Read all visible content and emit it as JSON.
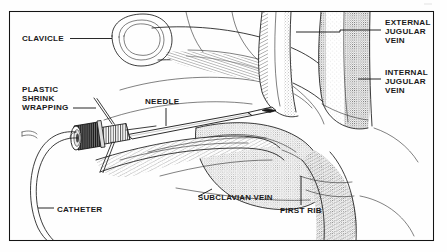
{
  "figure": {
    "kind": "line-art medical illustration",
    "background_color": "#fefefe",
    "ink_color": "#1a1a1a",
    "frame": {
      "present": true,
      "x": 9,
      "y": 11,
      "width": 425,
      "height": 230,
      "stroke_color": "#141414"
    }
  },
  "labels": [
    {
      "id": "clavicle",
      "lines": [
        "CLAVICLE"
      ],
      "text_x": 22,
      "text_y": 41,
      "align": "start",
      "leader": "M 70 38.5 L 112 38.5",
      "points_to": "clavicle bone cross-section, upper left"
    },
    {
      "id": "plastic-shrink-wrapping",
      "lines": [
        "PLASTIC",
        "SHRINK",
        "WRAPPING"
      ],
      "text_x": 22,
      "text_y": 92,
      "align": "start",
      "leader": "M 73 108 L 96 108",
      "points_to": "plastic shrink wrapping over needle hub"
    },
    {
      "id": "needle",
      "lines": [
        "NEEDLE"
      ],
      "text_x": 145,
      "text_y": 104,
      "align": "start",
      "leader": "M 166 108 L 166 126",
      "points_to": "needle shaft"
    },
    {
      "id": "catheter",
      "lines": [
        "CATHETER"
      ],
      "text_x": 57,
      "text_y": 212,
      "align": "start",
      "leader": "M 38 208 L 54 208",
      "points_to": "catheter tubing loop, lower left"
    },
    {
      "id": "subclavian-vein",
      "lines": [
        "SUBCLAVIAN VEIN"
      ],
      "text_x": 198,
      "text_y": 200,
      "align": "start",
      "leader": "M 198 196.5 L 212 189",
      "points_to": "subclavian vein beneath clavicle"
    },
    {
      "id": "first-rib",
      "lines": [
        "FIRST RIB"
      ],
      "text_x": 280,
      "text_y": 213,
      "align": "start",
      "leader": "M 301 176 L 301 205",
      "points_to": "first rib"
    },
    {
      "id": "external-jugular-vein",
      "lines": [
        "EXTERNAL",
        "JUGULAR",
        "VEIN"
      ],
      "text_x": 385,
      "text_y": 25,
      "align": "start",
      "leader": "M 296 32 L 340 32 L 340 30 L 381 30",
      "points_to": "external jugular vein, smaller left vessel"
    },
    {
      "id": "internal-jugular-vein",
      "lines": [
        "INTERNAL",
        "JUGULAR",
        "VEIN"
      ],
      "text_x": 385,
      "text_y": 75,
      "align": "start",
      "leader": "M 358 79 L 381 79",
      "points_to": "internal jugular vein, larger right vessel"
    }
  ],
  "anatomy": [
    {
      "id": "clavicle-bone",
      "name": "clavicle",
      "description": "cut end of clavicle shown as oval cross-section with stippled cancellous bone core"
    },
    {
      "id": "external-jugular-vein-vessel",
      "name": "external jugular vein",
      "description": "narrow stippled vessel descending left of the internal jugular"
    },
    {
      "id": "internal-jugular-vein-vessel",
      "name": "internal jugular vein",
      "description": "wide stippled vessel descending on the right"
    },
    {
      "id": "subclavian-vein-vessel",
      "name": "subclavian vein",
      "description": "vessel running horizontally beneath the clavicle toward the jugular junction"
    },
    {
      "id": "first-rib-bone",
      "name": "first rib",
      "description": "rib curving below the subclavian vein"
    },
    {
      "id": "skin-surface",
      "name": "chest wall skin",
      "description": "shaded chest and shoulder contour"
    }
  ],
  "instrument": [
    {
      "id": "needle-shaft",
      "name": "needle",
      "description": "long thin-wall needle angled from lower-left hub up to the right, bevel tip inside the subclavian vein"
    },
    {
      "id": "needle-hub",
      "name": "needle hub",
      "description": "dark knurled hub / luer connector at the needle's proximal end"
    },
    {
      "id": "shrink-wrap-sleeve",
      "name": "plastic shrink wrapping",
      "description": "ribbed transparent sleeve over the junction of hub and needle shaft"
    },
    {
      "id": "catheter-tube",
      "name": "catheter",
      "description": "flexible double-walled tube looping from the hub down and around to the lower left"
    }
  ]
}
